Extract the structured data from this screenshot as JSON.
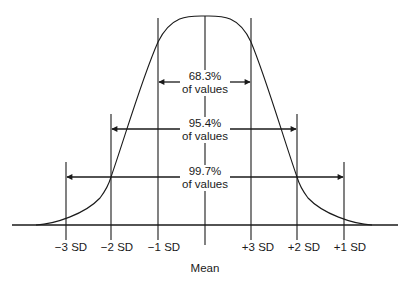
{
  "diagram": {
    "colors": {
      "ink": "#1a1a1a",
      "background": "#ffffff"
    },
    "axis": {
      "tick_labels": [
        "−3 SD",
        "−2 SD",
        "−1 SD",
        "+3 SD",
        "+2 SD",
        "+1 SD"
      ],
      "mean_label": "Mean"
    },
    "intervals": [
      {
        "percent": "68.3%",
        "caption": "of values"
      },
      {
        "percent": "95.4%",
        "caption": "of values"
      },
      {
        "percent": "99.7%",
        "caption": "of values"
      }
    ]
  }
}
